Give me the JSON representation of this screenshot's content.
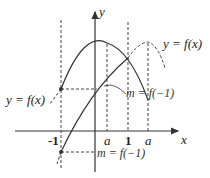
{
  "axes": {
    "x_label": "x",
    "y_label": "y",
    "x_ticks": [
      "-1",
      "a",
      "1",
      "a"
    ]
  },
  "labels": {
    "curve_right": "y = f(x)",
    "curve_left": "y = f(x)",
    "m_upper": "m = f(−1)",
    "m_lower": "m = f(−1)"
  },
  "colors": {
    "stroke": "#333333",
    "background": "#ffffff"
  }
}
